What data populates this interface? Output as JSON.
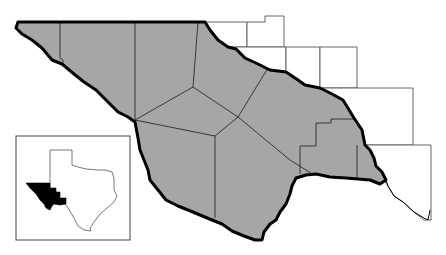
{
  "map": {
    "title": "",
    "region_fill_color": "#a6a6a6",
    "border_color": "#000000",
    "neighbor_fill_color": "#ffffff",
    "highlighted_region": "Trans-Pecos / Far West Texas counties",
    "county_count_shaded": 9
  },
  "inset": {
    "subject": "Texas locator map",
    "highlight_color": "#000000"
  }
}
